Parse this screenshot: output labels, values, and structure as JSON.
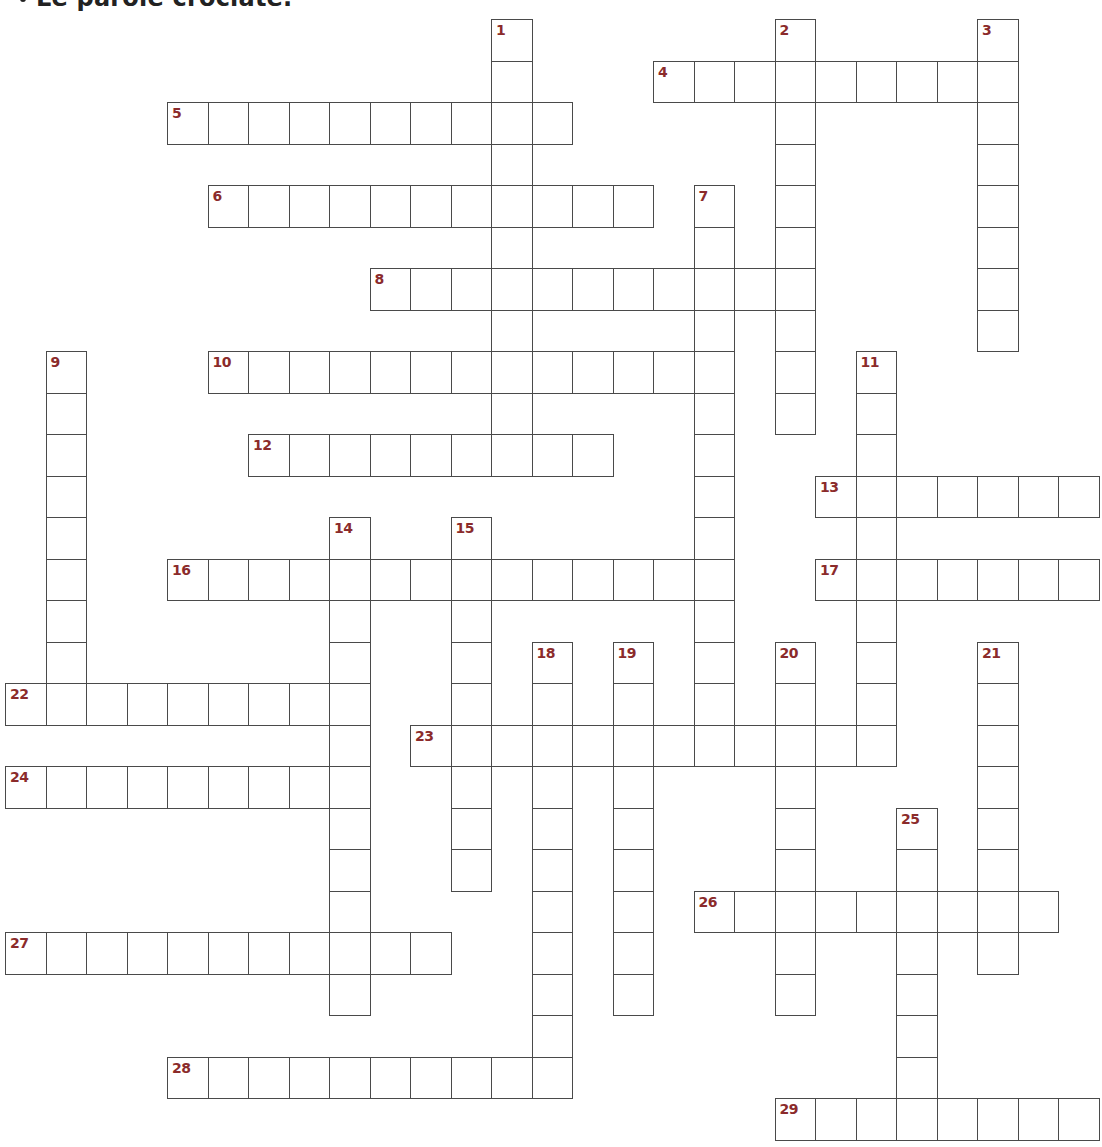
{
  "title": "Le parole crociate.",
  "colors": {
    "number": "#8b2b2b",
    "grid_line": "#4a4a4a",
    "background": "#ffffff"
  },
  "lattice": {
    "origin_x": 5,
    "origin_y": 19,
    "cell_w": 40.5,
    "cell_h": 41.5
  },
  "crossword": {
    "words": [
      {
        "number": 1,
        "direction": "down",
        "row": 0,
        "col": 12,
        "length": 11
      },
      {
        "number": 2,
        "direction": "down",
        "row": 0,
        "col": 19,
        "length": 10
      },
      {
        "number": 3,
        "direction": "down",
        "row": 0,
        "col": 24,
        "length": 8
      },
      {
        "number": 4,
        "direction": "across",
        "row": 1,
        "col": 16,
        "length": 9
      },
      {
        "number": 5,
        "direction": "across",
        "row": 2,
        "col": 4,
        "length": 10
      },
      {
        "number": 6,
        "direction": "across",
        "row": 4,
        "col": 5,
        "length": 11
      },
      {
        "number": 7,
        "direction": "down",
        "row": 4,
        "col": 17,
        "length": 14
      },
      {
        "number": 8,
        "direction": "across",
        "row": 6,
        "col": 9,
        "length": 11
      },
      {
        "number": 9,
        "direction": "down",
        "row": 8,
        "col": 1,
        "length": 9
      },
      {
        "number": 10,
        "direction": "across",
        "row": 8,
        "col": 5,
        "length": 13
      },
      {
        "number": 11,
        "direction": "down",
        "row": 8,
        "col": 21,
        "length": 10
      },
      {
        "number": 12,
        "direction": "across",
        "row": 10,
        "col": 6,
        "length": 9
      },
      {
        "number": 13,
        "direction": "across",
        "row": 11,
        "col": 20,
        "length": 7
      },
      {
        "number": 14,
        "direction": "down",
        "row": 12,
        "col": 8,
        "length": 12
      },
      {
        "number": 15,
        "direction": "down",
        "row": 12,
        "col": 11,
        "length": 9
      },
      {
        "number": 16,
        "direction": "across",
        "row": 13,
        "col": 4,
        "length": 14
      },
      {
        "number": 17,
        "direction": "across",
        "row": 13,
        "col": 20,
        "length": 7
      },
      {
        "number": 18,
        "direction": "down",
        "row": 15,
        "col": 13,
        "length": 11
      },
      {
        "number": 19,
        "direction": "down",
        "row": 15,
        "col": 15,
        "length": 9
      },
      {
        "number": 20,
        "direction": "down",
        "row": 15,
        "col": 19,
        "length": 9
      },
      {
        "number": 21,
        "direction": "down",
        "row": 15,
        "col": 24,
        "length": 8
      },
      {
        "number": 22,
        "direction": "across",
        "row": 16,
        "col": 0,
        "length": 9
      },
      {
        "number": 23,
        "direction": "across",
        "row": 17,
        "col": 10,
        "length": 12
      },
      {
        "number": 24,
        "direction": "across",
        "row": 18,
        "col": 0,
        "length": 9
      },
      {
        "number": 25,
        "direction": "down",
        "row": 19,
        "col": 22,
        "length": 8
      },
      {
        "number": 26,
        "direction": "across",
        "row": 21,
        "col": 17,
        "length": 9
      },
      {
        "number": 27,
        "direction": "across",
        "row": 22,
        "col": 0,
        "length": 11
      },
      {
        "number": 28,
        "direction": "across",
        "row": 25,
        "col": 4,
        "length": 10
      },
      {
        "number": 29,
        "direction": "across",
        "row": 26,
        "col": 19,
        "length": 8
      }
    ]
  }
}
